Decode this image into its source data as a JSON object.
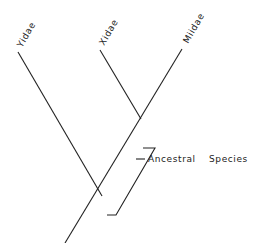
{
  "diagram": {
    "type": "cladogram",
    "taxa": [
      {
        "label": "Yidae"
      },
      {
        "label": "Xidae"
      },
      {
        "label": "Miidae"
      }
    ],
    "annotation": {
      "label_1": "Ancestral",
      "label_2": "Species"
    }
  }
}
